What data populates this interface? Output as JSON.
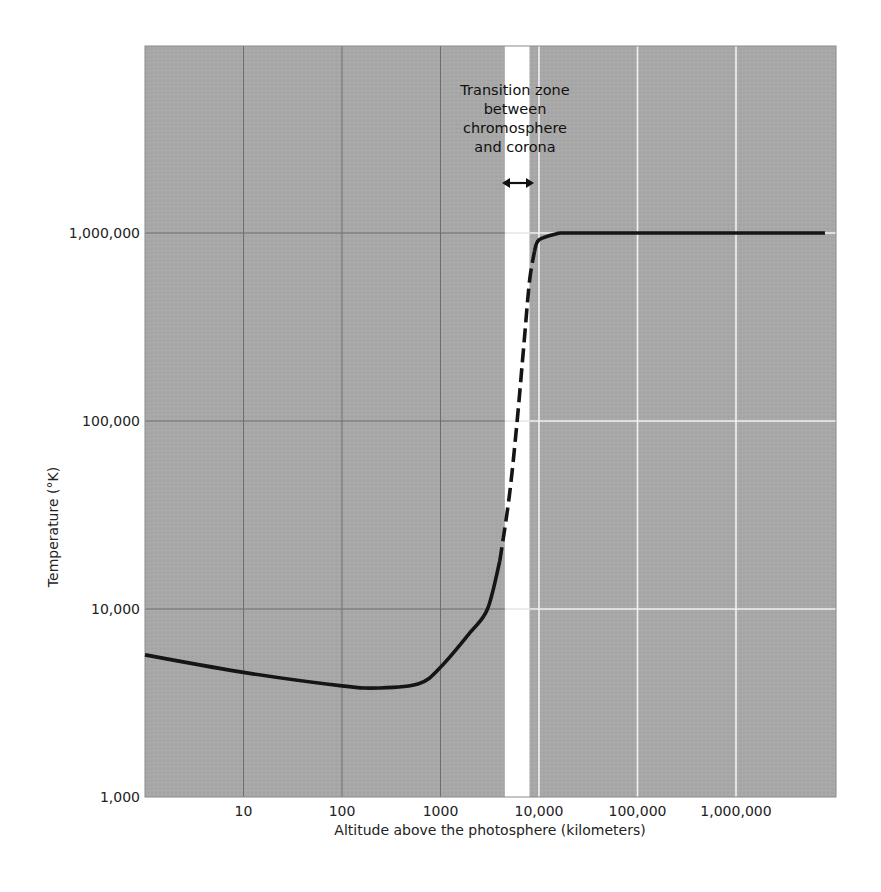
{
  "chart_data": {
    "type": "line",
    "title": "",
    "xlabel": "Altitude above the photosphere (kilometers)",
    "ylabel": "Temperature (°K)",
    "xscale": "log",
    "yscale": "log",
    "xlim": [
      1,
      10000000
    ],
    "ylim": [
      1000,
      10000000
    ],
    "grid": true,
    "x_ticks": [
      10,
      100,
      1000,
      10000,
      100000,
      1000000
    ],
    "x_tick_labels": [
      "10",
      "100",
      "1000",
      "10,000",
      "100,000",
      "1,000,000"
    ],
    "y_ticks": [
      1000,
      10000,
      100000,
      1000000
    ],
    "y_tick_labels": [
      "1,000",
      "10,000",
      "100,000",
      "1,000,000"
    ],
    "series": [
      {
        "name": "Solar atmosphere temperature",
        "style": "solid",
        "x": [
          1,
          10,
          100,
          240,
          600,
          1000,
          2000,
          3000,
          4000
        ],
        "y": [
          5700,
          4600,
          3900,
          3800,
          4000,
          4900,
          7500,
          10000,
          18000
        ]
      },
      {
        "name": "Transition (uncertain)",
        "style": "dashed",
        "x": [
          4000,
          5000,
          6000,
          7000,
          8000,
          9000
        ],
        "y": [
          18000,
          40000,
          100000,
          250000,
          550000,
          800000
        ]
      },
      {
        "name": "Corona",
        "style": "solid",
        "x": [
          9000,
          10000,
          15000,
          20000,
          100000,
          1000000,
          8000000
        ],
        "y": [
          800000,
          920000,
          990000,
          1000000,
          1000000,
          1000000,
          1000000
        ]
      }
    ],
    "shaded_band": {
      "x_range": [
        4500,
        8000
      ],
      "color": "#ffffff",
      "label": "Transition zone between chromosphere and corona"
    },
    "annotations": [
      {
        "text": "Transition zone",
        "line": 1
      },
      {
        "text": "between",
        "line": 2
      },
      {
        "text": "chromosphere",
        "line": 3
      },
      {
        "text": "and corona",
        "line": 4
      }
    ],
    "colors": {
      "plot_bg": "#a9a9a9",
      "grid_left": "#6e6e6e",
      "grid_right": "#f2f2f2",
      "curve": "#151515",
      "band": "#ffffff"
    }
  }
}
